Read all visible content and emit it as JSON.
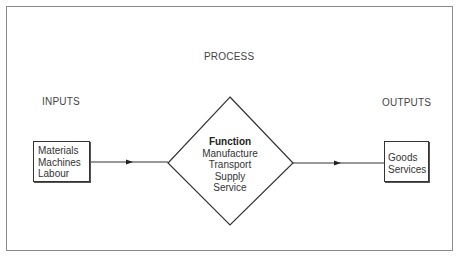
{
  "diagram": {
    "title": "PROCESS",
    "inputs_label": "INPUTS",
    "outputs_label": "OUTPUTS",
    "inputs_box": {
      "items": [
        "Materials",
        "Machines",
        "Labour"
      ]
    },
    "function": {
      "heading": "Function",
      "items": [
        "Manufacture",
        "Transport",
        "Supply",
        "Service"
      ]
    },
    "outputs_box": {
      "items": [
        "Goods",
        "Services"
      ]
    },
    "colors": {
      "line": "#333333",
      "frame": "#8a8a8a",
      "background": "#ffffff"
    }
  }
}
